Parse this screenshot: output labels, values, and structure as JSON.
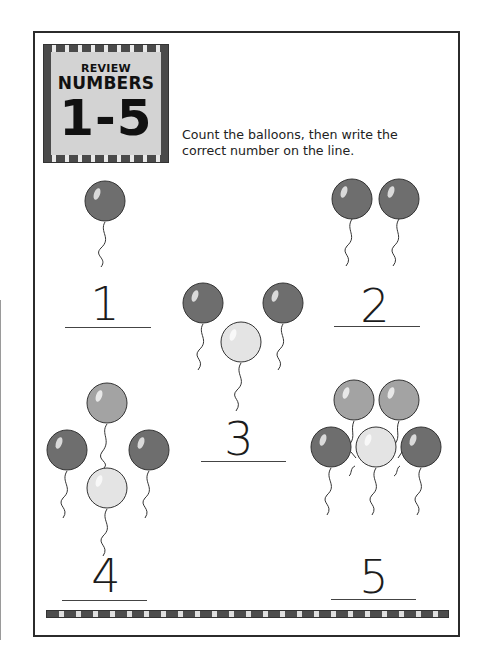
{
  "worksheet": {
    "title_box": {
      "line1": "REVIEW",
      "line2": "NUMBERS",
      "line3": "1-5"
    },
    "instructions": "Count the balloons, then write the correct number on the line.",
    "groups": [
      {
        "id": "group-1",
        "balloon_count": 1,
        "answer": "1"
      },
      {
        "id": "group-2",
        "balloon_count": 2,
        "answer": "2"
      },
      {
        "id": "group-3",
        "balloon_count": 3,
        "answer": "3"
      },
      {
        "id": "group-4",
        "balloon_count": 4,
        "answer": "4"
      },
      {
        "id": "group-5",
        "balloon_count": 5,
        "answer": "5"
      }
    ],
    "colors": {
      "balloon_dark": "#6e6e6e",
      "balloon_mid": "#a3a3a3",
      "balloon_light": "#e4e4e4",
      "title_bg": "#d3d3d3",
      "border_dark": "#2b2b2b"
    },
    "icons": [
      "balloon-icon",
      "checkered-border"
    ]
  }
}
